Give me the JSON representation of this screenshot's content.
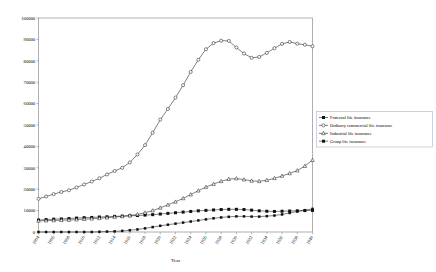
{
  "chart_data": {
    "type": "line",
    "title": "",
    "xlabel": "Year",
    "ylabel": "",
    "xlim": [
      1904,
      1940
    ],
    "ylim": [
      0,
      100000
    ],
    "ytick_labels": [
      "0",
      "10000",
      "20000",
      "30000",
      "40000",
      "50000",
      "60000",
      "70000",
      "80000",
      "90000",
      "100000"
    ],
    "ytick_values": [
      0,
      10000,
      20000,
      30000,
      40000,
      50000,
      60000,
      70000,
      80000,
      90000,
      100000
    ],
    "xtick_labels": [
      "1904",
      "1906",
      "1908",
      "1910",
      "1912",
      "1914",
      "1916",
      "1918",
      "1920",
      "1922",
      "1924",
      "1926",
      "1928",
      "1930",
      "1932",
      "1934",
      "1936",
      "1938",
      "1940"
    ],
    "xtick_values": [
      1904,
      1906,
      1908,
      1910,
      1912,
      1914,
      1916,
      1918,
      1920,
      1922,
      1924,
      1926,
      1928,
      1930,
      1932,
      1934,
      1936,
      1938,
      1940
    ],
    "grid": false,
    "legend_position": "right",
    "x": [
      1904,
      1905,
      1906,
      1907,
      1908,
      1909,
      1910,
      1911,
      1912,
      1913,
      1914,
      1915,
      1916,
      1917,
      1918,
      1919,
      1920,
      1921,
      1922,
      1923,
      1924,
      1925,
      1926,
      1927,
      1928,
      1929,
      1930,
      1931,
      1932,
      1933,
      1934,
      1935,
      1936,
      1937,
      1938,
      1939,
      1940
    ],
    "series": [
      {
        "name": "Fraternal life insurance",
        "marker": "filled-square",
        "values": [
          5600,
          5800,
          6000,
          6100,
          6300,
          6500,
          6700,
          6800,
          7000,
          7100,
          7300,
          7400,
          7600,
          7700,
          7900,
          8100,
          8400,
          8700,
          9000,
          9300,
          9600,
          9900,
          10100,
          10300,
          10500,
          10600,
          10600,
          10500,
          10200,
          9900,
          9700,
          9600,
          9700,
          9800,
          9900,
          10000,
          10100
        ]
      },
      {
        "name": "Ordinary commercial life insurance",
        "marker": "open-circle",
        "values": [
          15500,
          16600,
          17700,
          18700,
          19500,
          20800,
          22200,
          23600,
          25100,
          26900,
          28500,
          30000,
          32500,
          36200,
          40600,
          46400,
          52500,
          57500,
          62800,
          68600,
          74800,
          80500,
          85400,
          88300,
          89400,
          89300,
          86200,
          83400,
          81400,
          81800,
          83700,
          85900,
          87900,
          88800,
          88000,
          87500,
          86800
        ]
      },
      {
        "name": "Industrial life insurance",
        "marker": "open-triangle",
        "values": [
          5200,
          5300,
          5400,
          5500,
          5600,
          5800,
          6000,
          6200,
          6400,
          6700,
          7000,
          7300,
          7700,
          8200,
          9000,
          10000,
          11300,
          12700,
          14100,
          15700,
          17500,
          19300,
          21000,
          22400,
          23700,
          24700,
          25000,
          24500,
          23900,
          23700,
          24200,
          25100,
          26200,
          27400,
          28700,
          30800,
          33600
        ]
      },
      {
        "name": "Group life insurance",
        "marker": "filled-square-small",
        "values": [
          0,
          0,
          0,
          0,
          0,
          0,
          0,
          0,
          100,
          200,
          300,
          500,
          800,
          1200,
          1700,
          2300,
          2900,
          3400,
          3900,
          4400,
          4900,
          5400,
          5900,
          6400,
          6800,
          7100,
          7300,
          7300,
          7200,
          7200,
          7400,
          7700,
          8200,
          8900,
          9600,
          10200,
          10800
        ]
      }
    ]
  },
  "legend": {
    "items": [
      {
        "label": "Fraternal life insurance"
      },
      {
        "label": "Ordinary commercial life insurance"
      },
      {
        "label": "Industrial life insurance"
      },
      {
        "label": "Group life insurance"
      }
    ]
  }
}
